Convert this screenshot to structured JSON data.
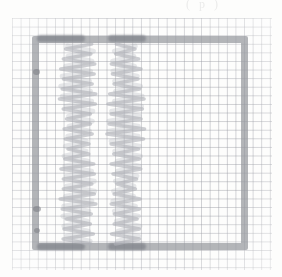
{
  "page": {
    "medium": "scanned hand-drawn pencil sketch on graph paper",
    "background_color": "#fdfdfc",
    "width": 282,
    "height": 277
  },
  "caption": {
    "text": "( p )",
    "note": "partially cropped faint text at top edge"
  },
  "graph_paper": {
    "name": "graph-paper-sheet",
    "grid_line_color": "#969aa0",
    "grid_spacing_px": 8.6,
    "left": 12,
    "top": 18,
    "width": 260,
    "height": 252
  },
  "frame": {
    "name": "hand-drawn-rectangle",
    "stroke_color": "#969aa0",
    "stroke_width_px": 7,
    "left": 32,
    "top": 36,
    "width": 216,
    "height": 214,
    "ink_blobs": [
      {
        "name": "blob-top-left",
        "x": 37,
        "y": 35,
        "w": 48,
        "h": 7
      },
      {
        "name": "blob-top-center",
        "x": 108,
        "y": 35,
        "w": 38,
        "h": 7
      },
      {
        "name": "blob-bottom-left",
        "x": 37,
        "y": 243,
        "w": 48,
        "h": 7
      },
      {
        "name": "blob-bottom-center",
        "x": 108,
        "y": 243,
        "w": 38,
        "h": 7
      }
    ],
    "edge_dots": [
      {
        "name": "dot-left-upper",
        "x": 33,
        "y": 69
      },
      {
        "name": "dot-left-lower",
        "x": 33,
        "y": 206
      },
      {
        "name": "dot-left-bottom",
        "x": 34,
        "y": 228
      }
    ]
  },
  "chart_data": {
    "type": "line",
    "title": "",
    "subtitle": "",
    "xlabel": "",
    "ylabel": "",
    "grid": true,
    "legend": null,
    "annotations": [],
    "series": [
      {
        "name": "left-scribble-column",
        "orientation": "vertical-oscillation",
        "stroke_color": "#b0b2b8",
        "x_center": 78,
        "y_range": [
          44,
          246
        ],
        "amplitude_profile": [
          {
            "y": 44,
            "amp": 30
          },
          {
            "y": 60,
            "amp": 28
          },
          {
            "y": 76,
            "amp": 32
          },
          {
            "y": 92,
            "amp": 34
          },
          {
            "y": 108,
            "amp": 30
          },
          {
            "y": 124,
            "amp": 26
          },
          {
            "y": 140,
            "amp": 22
          },
          {
            "y": 156,
            "amp": 26
          },
          {
            "y": 172,
            "amp": 30
          },
          {
            "y": 188,
            "amp": 33
          },
          {
            "y": 204,
            "amp": 31
          },
          {
            "y": 220,
            "amp": 28
          },
          {
            "y": 236,
            "amp": 26
          },
          {
            "y": 246,
            "amp": 24
          }
        ]
      },
      {
        "name": "right-scribble-column",
        "orientation": "vertical-oscillation",
        "stroke_color": "#b0b2b8",
        "x_center": 126,
        "y_range": [
          44,
          246
        ],
        "amplitude_profile": [
          {
            "y": 44,
            "amp": 22
          },
          {
            "y": 60,
            "amp": 24
          },
          {
            "y": 76,
            "amp": 27
          },
          {
            "y": 92,
            "amp": 30
          },
          {
            "y": 108,
            "amp": 33
          },
          {
            "y": 124,
            "amp": 35
          },
          {
            "y": 140,
            "amp": 32
          },
          {
            "y": 156,
            "amp": 28
          },
          {
            "y": 172,
            "amp": 24
          },
          {
            "y": 188,
            "amp": 22
          },
          {
            "y": 204,
            "amp": 25
          },
          {
            "y": 220,
            "amp": 27
          },
          {
            "y": 236,
            "amp": 24
          },
          {
            "y": 246,
            "amp": 20
          }
        ]
      }
    ],
    "colors": {
      "paper": "#fefefd",
      "grid": "#969aa0",
      "frame_ink": "#969aa0",
      "scribble_ink": "#b0b2b8",
      "dark_ink": "#787a82"
    }
  }
}
